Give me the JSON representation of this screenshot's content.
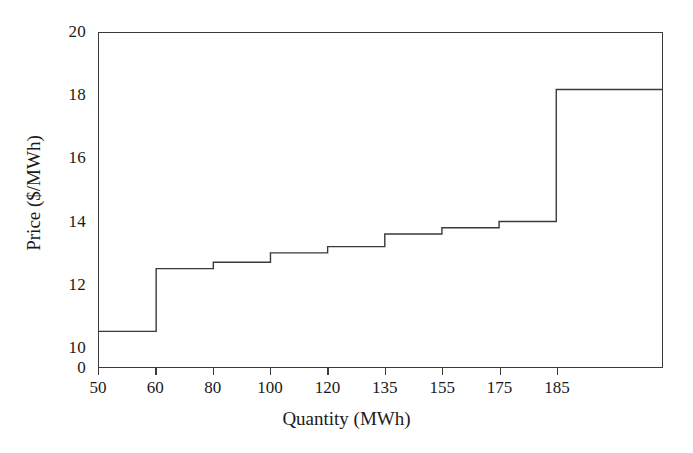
{
  "chart_data": {
    "type": "line",
    "subtype": "step-staircase",
    "title": "",
    "xlabel": "Quantity (MWh)",
    "ylabel": "Price ($/MWh)",
    "x_tick_labels": [
      "50",
      "60",
      "80",
      "100",
      "120",
      "135",
      "155",
      "175",
      "185"
    ],
    "x_tick_values": [
      50,
      60,
      80,
      100,
      120,
      135,
      155,
      175,
      185
    ],
    "y_tick_labels": [
      "0",
      "10",
      "12",
      "14",
      "16",
      "18",
      "20"
    ],
    "y_tick_values": [
      0,
      10,
      12,
      14,
      16,
      18,
      20
    ],
    "ylim": [
      10,
      20
    ],
    "y_axis_broken": true,
    "y_axis_break_note": "axis jumps from 0 directly to 10",
    "grid": false,
    "legend": null,
    "series": [
      {
        "name": "Offer curve",
        "steps": [
          {
            "quantity_label": "50",
            "price": 10.5
          },
          {
            "quantity_label": "60",
            "price": 12.5
          },
          {
            "quantity_label": "80",
            "price": 12.7
          },
          {
            "quantity_label": "100",
            "price": 13.0
          },
          {
            "quantity_label": "120",
            "price": 13.2
          },
          {
            "quantity_label": "135",
            "price": 13.6
          },
          {
            "quantity_label": "155",
            "price": 13.8
          },
          {
            "quantity_label": "175",
            "price": 14.0
          },
          {
            "quantity_label": "185",
            "price": 18.2
          }
        ],
        "x": [
          50,
          60,
          80,
          100,
          120,
          135,
          155,
          175,
          185
        ],
        "values": [
          10.5,
          12.5,
          12.7,
          13.0,
          13.2,
          13.6,
          13.8,
          14.0,
          18.2
        ]
      }
    ],
    "line_color": "#3a3a3a"
  },
  "figure": {
    "background": "#ffffff",
    "frame_color": "#3a3a3a"
  }
}
